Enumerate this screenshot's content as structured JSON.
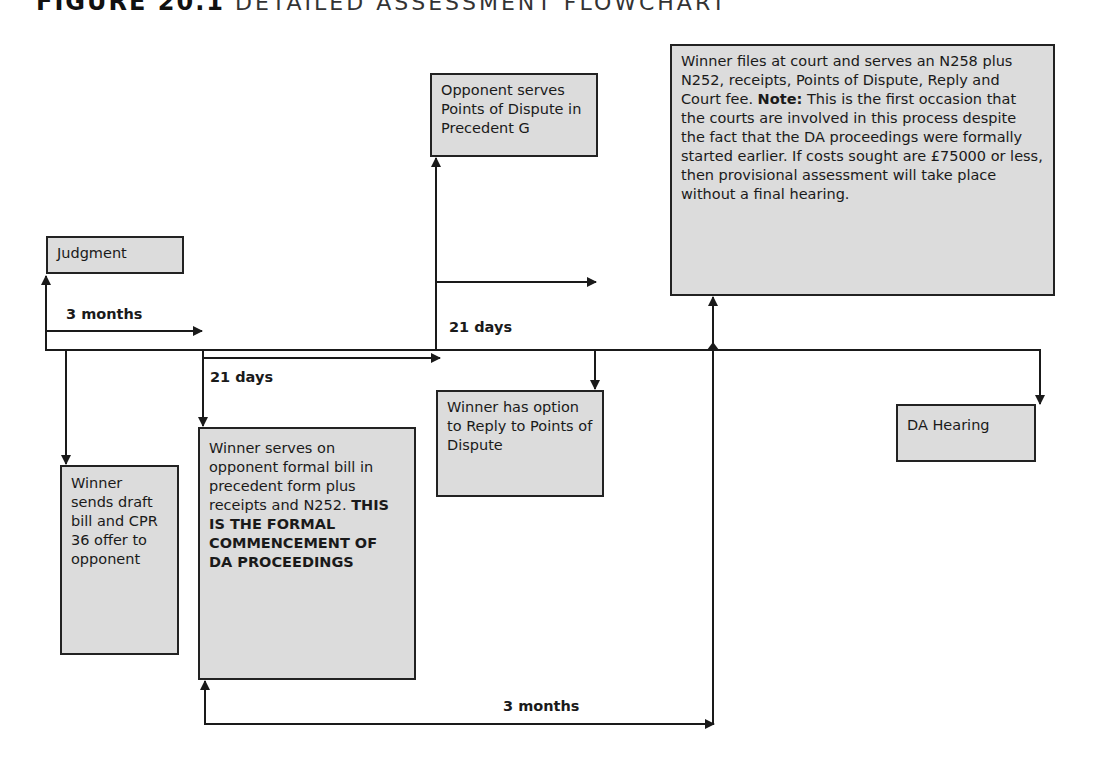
{
  "figure": {
    "number": "FIGURE 20.1",
    "caption": "DETAILED ASSESSMENT FLOWCHART"
  },
  "boxes": {
    "judgment": {
      "text": "Judgment"
    },
    "draft_bill": {
      "text": "Winner sends draft bill and CPR 36 offer to opponent"
    },
    "formal_bill": {
      "text": "Winner serves on opponent formal bill in precedent form plus receipts and N252.",
      "bold_text": "THIS IS THE FORMAL COMMENCEMENT OF DA PROCEEDINGS"
    },
    "points_of_dispute": {
      "text": "Opponent serves Points of Dispute in Precedent G"
    },
    "reply_option": {
      "text": "Winner has option to Reply to Points of Dispute"
    },
    "court_filing": {
      "text": "Winner files at court and serves an N258 plus N252, receipts, Points of Dispute, Reply and Court fee.",
      "note_label": "Note:",
      "note_text": "This is the first occasion that the courts are involved in this process despite the fact that the DA proceedings were formally started earlier. If costs sought are £75000 or less, then provisional assessment will take place without a final hearing."
    },
    "da_hearing": {
      "text": "DA Hearing"
    }
  },
  "labels": {
    "three_months_top": "3 months",
    "twenty_one_days_left": "21 days",
    "twenty_one_days_right": "21 days",
    "three_months_bottom": "3 months"
  },
  "colors": {
    "box_fill": "#dcdcdc",
    "line": "#1a1a1a"
  }
}
